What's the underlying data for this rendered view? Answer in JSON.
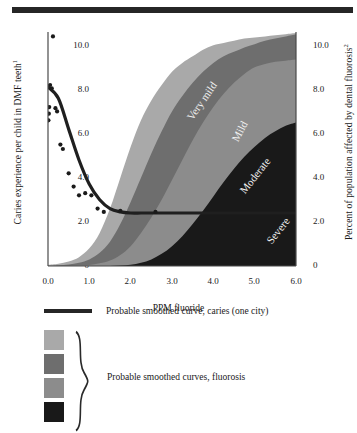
{
  "figure": {
    "title": "",
    "top_rule": true
  },
  "axes": {
    "left_title": "Caries experience per child in DMF teeth",
    "left_title_sup": "1",
    "right_title": "Percent of population affected by dental fluorosis",
    "right_title_sup": "2",
    "x_title": "PPM fluoride",
    "left_ticks": [
      "10.0",
      "8.0",
      "6.0",
      "4.0",
      "2.0",
      "0"
    ],
    "right_ticks": [
      "10.0",
      "8.0",
      "6.0",
      "4.0",
      "2.0",
      "0"
    ],
    "x_ticks": [
      "0.0",
      "1.0",
      "2.0",
      "3.0",
      "4.0",
      "5.0",
      "6.0"
    ]
  },
  "band_labels": {
    "very_mild": "Very mild",
    "mild": "Mild",
    "moderate": "Moderate",
    "severe": "Severe"
  },
  "colors": {
    "very_mild": "#a9a9a9",
    "mild": "#6e6e6e",
    "moderate": "#8c8c8c",
    "severe": "#191919",
    "caries_curve": "#1f1f1f",
    "axis": "#4a4a4a",
    "text": "#1a1a1a",
    "background": "#ffffff"
  },
  "legend": {
    "curve_label": "Probable smoothed curve, caries (one city)",
    "bands_label": "Probable smoothed curves, fluorosis",
    "swatches": [
      {
        "name": "very-mild-swatch",
        "color": "#a9a9a9"
      },
      {
        "name": "mild-swatch",
        "color": "#6e6e6e"
      },
      {
        "name": "moderate-swatch",
        "color": "#8c8c8c"
      },
      {
        "name": "severe-swatch",
        "color": "#191919"
      }
    ]
  },
  "chart_data": {
    "type": "area",
    "title": "",
    "xlabel": "PPM fluoride",
    "ylabel": "Caries experience per child in DMF teeth",
    "ylabel_right": "Percent of population affected by dental fluorosis",
    "xlim": [
      0.0,
      6.0
    ],
    "ylim": [
      0.0,
      10.6
    ],
    "ylim_right": [
      0.0,
      10.6
    ],
    "grid": false,
    "legend_position": "below",
    "x": [
      0.0,
      0.25,
      0.5,
      0.75,
      1.0,
      1.25,
      1.5,
      1.75,
      2.0,
      2.25,
      2.5,
      2.75,
      3.0,
      3.25,
      3.5,
      3.75,
      4.0,
      4.25,
      4.5,
      4.75,
      5.0,
      5.25,
      5.5,
      5.75,
      6.0
    ],
    "series": [
      {
        "name": "Very mild",
        "type": "band-upper",
        "color": "#a9a9a9",
        "values": [
          0.05,
          0.1,
          0.2,
          0.4,
          0.8,
          1.5,
          2.6,
          4.0,
          5.4,
          6.6,
          7.5,
          8.2,
          8.8,
          9.2,
          9.5,
          9.8,
          10.0,
          10.1,
          10.2,
          10.3,
          10.35,
          10.4,
          10.45,
          10.5,
          10.55
        ]
      },
      {
        "name": "Mild",
        "type": "band-upper",
        "color": "#6e6e6e",
        "values": [
          0.0,
          0.03,
          0.07,
          0.15,
          0.3,
          0.6,
          1.1,
          1.9,
          2.9,
          4.0,
          5.1,
          6.1,
          7.0,
          7.7,
          8.3,
          8.8,
          9.2,
          9.5,
          9.7,
          9.9,
          10.05,
          10.2,
          10.3,
          10.4,
          10.5
        ]
      },
      {
        "name": "Moderate",
        "type": "band-upper",
        "color": "#8c8c8c",
        "values": [
          0.0,
          0.0,
          0.0,
          0.02,
          0.05,
          0.12,
          0.25,
          0.5,
          0.9,
          1.5,
          2.2,
          3.0,
          3.9,
          4.8,
          5.7,
          6.5,
          7.2,
          7.8,
          8.3,
          8.7,
          9.0,
          9.15,
          9.25,
          9.3,
          9.35
        ]
      },
      {
        "name": "Severe",
        "type": "band-upper",
        "color": "#191919",
        "values": [
          0.0,
          0.0,
          0.0,
          0.0,
          0.0,
          0.0,
          0.0,
          0.02,
          0.06,
          0.15,
          0.3,
          0.55,
          0.9,
          1.35,
          1.9,
          2.5,
          3.15,
          3.8,
          4.4,
          4.95,
          5.4,
          5.8,
          6.1,
          6.35,
          6.5
        ]
      },
      {
        "name": "Probable smoothed curve, caries (one city)",
        "type": "line",
        "color": "#1f1f1f",
        "values": [
          8.1,
          7.6,
          6.2,
          4.8,
          3.7,
          3.0,
          2.6,
          2.45,
          2.4,
          2.4,
          2.4,
          2.4,
          2.4,
          2.4,
          2.4,
          2.4,
          2.4,
          2.4,
          2.4,
          2.4,
          2.4,
          2.4,
          2.4,
          2.4,
          2.4
        ]
      }
    ],
    "scatter": {
      "name": "Caries observations",
      "color": "#1a1a1a",
      "points": [
        [
          0.12,
          10.4
        ],
        [
          0.05,
          8.2
        ],
        [
          0.09,
          8.05
        ],
        [
          0.03,
          7.2
        ],
        [
          0.02,
          6.9
        ],
        [
          0.01,
          6.6
        ],
        [
          0.18,
          7.15
        ],
        [
          0.22,
          7.0
        ],
        [
          0.3,
          5.5
        ],
        [
          0.36,
          5.3
        ],
        [
          0.5,
          4.2
        ],
        [
          0.62,
          3.6
        ],
        [
          0.75,
          3.2
        ],
        [
          0.9,
          3.3
        ],
        [
          1.05,
          3.2
        ],
        [
          1.2,
          2.6
        ],
        [
          1.35,
          2.45
        ],
        [
          1.75,
          2.5
        ],
        [
          2.6,
          2.45
        ]
      ]
    }
  }
}
